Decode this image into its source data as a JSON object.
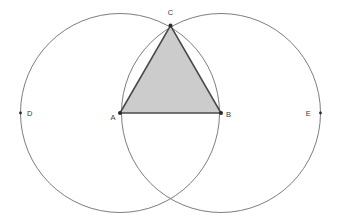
{
  "figure": {
    "canvas": {
      "width": 338,
      "height": 224
    },
    "background_color": "#ffffff"
  },
  "style": {
    "circle_stroke_color": "#6e6e6e",
    "circle_stroke_width": 0.9,
    "triangle_fill_color": "#cccccc",
    "triangle_edge_color": "#4a4a4a",
    "triangle_edge_width": 1.6,
    "point_color": "#2b2b2b",
    "label_color": "#3a3a3a",
    "label_font_size": 7.5
  },
  "points": [
    {
      "id": "A",
      "label": "A",
      "x": 120,
      "y": 113,
      "label_x": 113,
      "label_y": 120,
      "role": "left-circle-center",
      "dot_radius": 2.0
    },
    {
      "id": "B",
      "label": "B",
      "x": 221,
      "y": 113,
      "label_x": 226,
      "label_y": 117,
      "role": "right-circle-center",
      "dot_radius": 2.0
    },
    {
      "id": "C",
      "label": "C",
      "x": 170.5,
      "y": 25.5,
      "label_x": 170.5,
      "label_y": 15,
      "role": "upper-circle-intersection",
      "dot_radius": 2.0
    },
    {
      "id": "D",
      "label": "D",
      "x": 20.5,
      "y": 113,
      "label_x": 27,
      "label_y": 116,
      "role": "left-circle-leftmost",
      "dot_radius": 1.4
    },
    {
      "id": "E",
      "label": "E",
      "x": 320.5,
      "y": 113,
      "label_x": 311,
      "label_y": 116,
      "role": "right-circle-rightmost",
      "dot_radius": 1.4
    }
  ],
  "circles": [
    {
      "id": "circle-A",
      "center": "A",
      "cx": 120,
      "cy": 113,
      "r": 99.5,
      "passes_through": [
        "B",
        "C",
        "D"
      ]
    },
    {
      "id": "circle-B",
      "center": "B",
      "cx": 221,
      "cy": 113,
      "r": 99.5,
      "passes_through": [
        "A",
        "C",
        "E"
      ]
    }
  ],
  "triangle": {
    "id": "triangle-ABC",
    "vertices": [
      "A",
      "B",
      "C"
    ],
    "path": "M 120 113 L 221 113 L 170.5 25.5 Z",
    "shaded": true,
    "type": "equilateral"
  },
  "labels": {
    "A": "A",
    "B": "B",
    "C": "C",
    "D": "D",
    "E": "E"
  }
}
